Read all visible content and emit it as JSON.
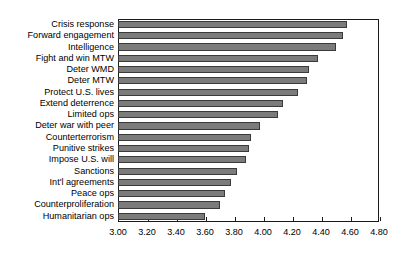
{
  "chart_data": {
    "type": "bar",
    "orientation": "horizontal",
    "title": "",
    "xlabel": "",
    "ylabel": "",
    "xlim": [
      3.0,
      4.8
    ],
    "grid": false,
    "legend": null,
    "xticks": [
      "3.00",
      "3.20",
      "3.40",
      "3.60",
      "3.80",
      "4.00",
      "4.20",
      "4.40",
      "4.60",
      "4.80"
    ],
    "xtick_values": [
      3.0,
      3.2,
      3.4,
      3.6,
      3.8,
      4.0,
      4.2,
      4.4,
      4.6,
      4.8
    ],
    "bar_color": "#7b7b7b",
    "bar_edge_color": "#3a3a3a",
    "axis_color": "#1a1a1a",
    "categories": [
      "Crisis response",
      "Forward engagement",
      "Intelligence",
      "Fight and win MTW",
      "Deter WMD",
      "Deter MTW",
      "Protect U.S. lives",
      "Extend deterrence",
      "Limited ops",
      "Deter war with peer",
      "Counterterrorism",
      "Punitive strikes",
      "Impose U.S. will",
      "Sanctions",
      "Int'l agreements",
      "Peace ops",
      "Counterproliferation",
      "Humanitarian ops"
    ],
    "values": [
      4.58,
      4.55,
      4.5,
      4.38,
      4.32,
      4.3,
      4.24,
      4.14,
      4.1,
      3.98,
      3.92,
      3.9,
      3.88,
      3.82,
      3.78,
      3.74,
      3.7,
      3.6
    ]
  }
}
